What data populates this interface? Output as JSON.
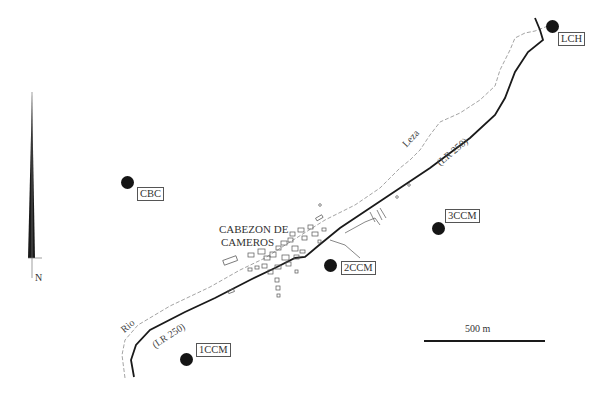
{
  "map": {
    "north_label": "N",
    "town_label_line1": "CABEZON DE",
    "town_label_line2": "CAMEROS",
    "river_label_1": "Rio",
    "river_label_2": "Leza",
    "road_label_1": "(LR 250)",
    "road_label_2": "(LR 250)",
    "scale_label": "500 m",
    "stations": [
      {
        "id": "LCH",
        "label": "LCH"
      },
      {
        "id": "CBC",
        "label": "CBC"
      },
      {
        "id": "3CCM",
        "label": "3CCM"
      },
      {
        "id": "2CCM",
        "label": "2CCM"
      },
      {
        "id": "1CCM",
        "label": "1CCM"
      }
    ],
    "colors": {
      "road": "#1a1a1a",
      "river": "#9a9a9a",
      "station": "#151515"
    }
  }
}
